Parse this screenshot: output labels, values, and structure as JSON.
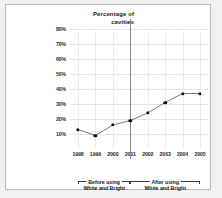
{
  "chart_data": {
    "type": "line",
    "title": "Percentage of cavities",
    "xlabel": "",
    "ylabel": "Percentage of cavities",
    "categories": [
      "1998",
      "1999",
      "2000",
      "2001",
      "2002",
      "2003",
      "2004",
      "2005"
    ],
    "values": [
      13,
      9,
      16,
      19,
      24,
      31,
      37,
      37
    ],
    "series": [
      {
        "name": "Percentage of cavities",
        "values": [
          13,
          9,
          16,
          19,
          24,
          31,
          37,
          37
        ]
      }
    ],
    "ylim": [
      0,
      80
    ],
    "yticks": [
      10,
      20,
      30,
      40,
      50,
      60,
      70,
      80
    ],
    "ytick_labels": [
      "10%",
      "20%",
      "30%",
      "40%",
      "50%",
      "60%",
      "70%",
      "80%"
    ],
    "grid": true,
    "legend": false,
    "marker": "filled-circle",
    "line_color": "#555555",
    "marker_color": "#111111",
    "grid_color": "#e6e6e6",
    "divider": {
      "at_category": "2001",
      "color": "#8a8a8a"
    },
    "annotations": [
      {
        "id": "before-bracket",
        "caption": "Before using",
        "subcaption": "White and Bright",
        "from_category": "1998",
        "to_category": "2001"
      },
      {
        "id": "after-bracket",
        "caption": "After using",
        "subcaption": "White and Bright",
        "from_category": "2001",
        "to_category": "2005"
      }
    ]
  },
  "title": {
    "line1": "Percentage of",
    "line2": "cavities"
  },
  "brackets": {
    "before": {
      "caption": "Before using",
      "subcaption": "White and Bright"
    },
    "after": {
      "caption": "After using",
      "subcaption": "White and Bright"
    }
  }
}
